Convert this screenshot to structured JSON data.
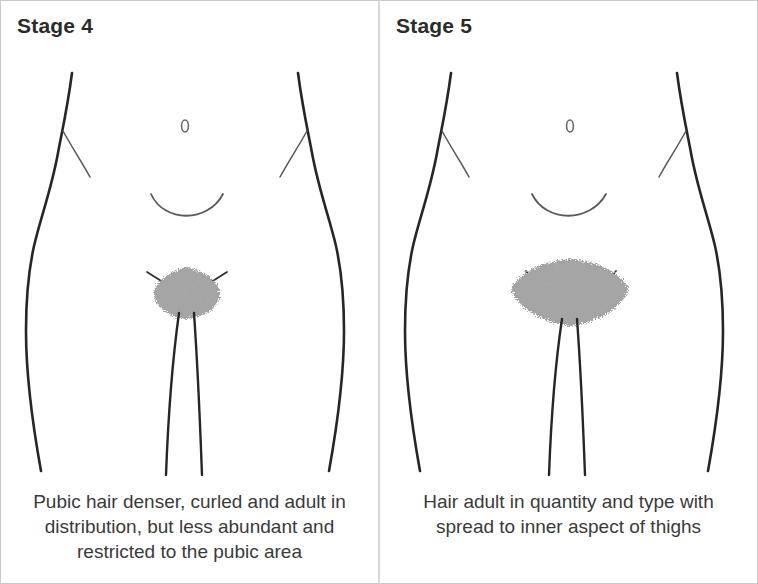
{
  "figure": {
    "type": "medical-illustration",
    "panel_count": 2,
    "colors": {
      "background": "#ffffff",
      "outline": "#262626",
      "hair_fill": "#a3a3a3",
      "title_text": "#2b2b2b",
      "caption_text": "#3a3a3a",
      "panel_border": "#c9c9c9"
    }
  },
  "panels": [
    {
      "title": "Stage 4",
      "caption": "Pubic hair denser, curled and adult in distribution, but less abundant and restricted to the pubic area",
      "caption_lines": [
        "Pubic hair denser, curled and adult in",
        "distribution, but less abundant and",
        "restricted to the pubic area"
      ],
      "navel_glyph": "0",
      "hair_region": {
        "shape": "rounded-diamond",
        "width_px": 66,
        "height_px": 52,
        "spread": "restricted to pubic area"
      }
    },
    {
      "title": "Stage 5",
      "caption": "Hair adult in quantity and type with spread to inner aspect of thighs",
      "caption_lines": [
        "Hair adult in quantity and type with",
        "spread to inner aspect of thighs"
      ],
      "navel_glyph": "0",
      "hair_region": {
        "shape": "wide-lens",
        "width_px": 116,
        "height_px": 62,
        "spread": "spread to inner aspect of thighs"
      }
    }
  ]
}
